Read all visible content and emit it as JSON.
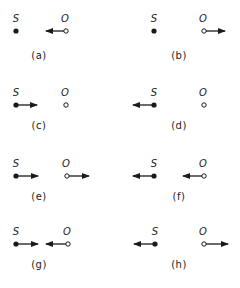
{
  "figure": {
    "colors": {
      "ink": "#1a1a1a",
      "background": "#ffffff"
    },
    "source_label": "S",
    "observer_label": "O",
    "panels": [
      {
        "id": "a",
        "caption": "(a)",
        "row": 0,
        "col": 0,
        "source": {
          "x": 16,
          "y": 31,
          "arrow_to": null
        },
        "observer": {
          "x": 66,
          "y": 31,
          "arrow_to": 46
        }
      },
      {
        "id": "b",
        "caption": "(b)",
        "row": 0,
        "col": 1,
        "source": {
          "x": 154,
          "y": 31,
          "arrow_to": null
        },
        "observer": {
          "x": 204,
          "y": 31,
          "arrow_to": 225
        }
      },
      {
        "id": "c",
        "caption": "(c)",
        "row": 1,
        "col": 0,
        "source": {
          "x": 16,
          "y": 105,
          "arrow_to": 37
        },
        "observer": {
          "x": 66,
          "y": 105,
          "arrow_to": null
        }
      },
      {
        "id": "d",
        "caption": "(d)",
        "row": 1,
        "col": 1,
        "source": {
          "x": 154,
          "y": 105,
          "arrow_to": 133
        },
        "observer": {
          "x": 204,
          "y": 105,
          "arrow_to": null
        }
      },
      {
        "id": "e",
        "caption": "(e)",
        "row": 2,
        "col": 0,
        "source": {
          "x": 16,
          "y": 176,
          "arrow_to": 38
        },
        "observer": {
          "x": 67,
          "y": 176,
          "arrow_to": 89
        }
      },
      {
        "id": "f",
        "caption": "(f)",
        "row": 2,
        "col": 1,
        "source": {
          "x": 154,
          "y": 176,
          "arrow_to": 133
        },
        "observer": {
          "x": 204,
          "y": 176,
          "arrow_to": 183
        }
      },
      {
        "id": "g",
        "caption": "(g)",
        "row": 3,
        "col": 0,
        "source": {
          "x": 16,
          "y": 244,
          "arrow_to": 38
        },
        "observer": {
          "x": 68,
          "y": 244,
          "arrow_to": 46
        }
      },
      {
        "id": "h",
        "caption": "(h)",
        "row": 3,
        "col": 1,
        "source": {
          "x": 155,
          "y": 244,
          "arrow_to": 134
        },
        "observer": {
          "x": 204,
          "y": 244,
          "arrow_to": 228
        }
      }
    ],
    "caption_positions": [
      {
        "x": 39,
        "y": 56
      },
      {
        "x": 179,
        "y": 56
      },
      {
        "x": 39,
        "y": 126
      },
      {
        "x": 179,
        "y": 126
      },
      {
        "x": 39,
        "y": 197
      },
      {
        "x": 179,
        "y": 197
      },
      {
        "x": 39,
        "y": 265
      },
      {
        "x": 179,
        "y": 265
      }
    ]
  }
}
